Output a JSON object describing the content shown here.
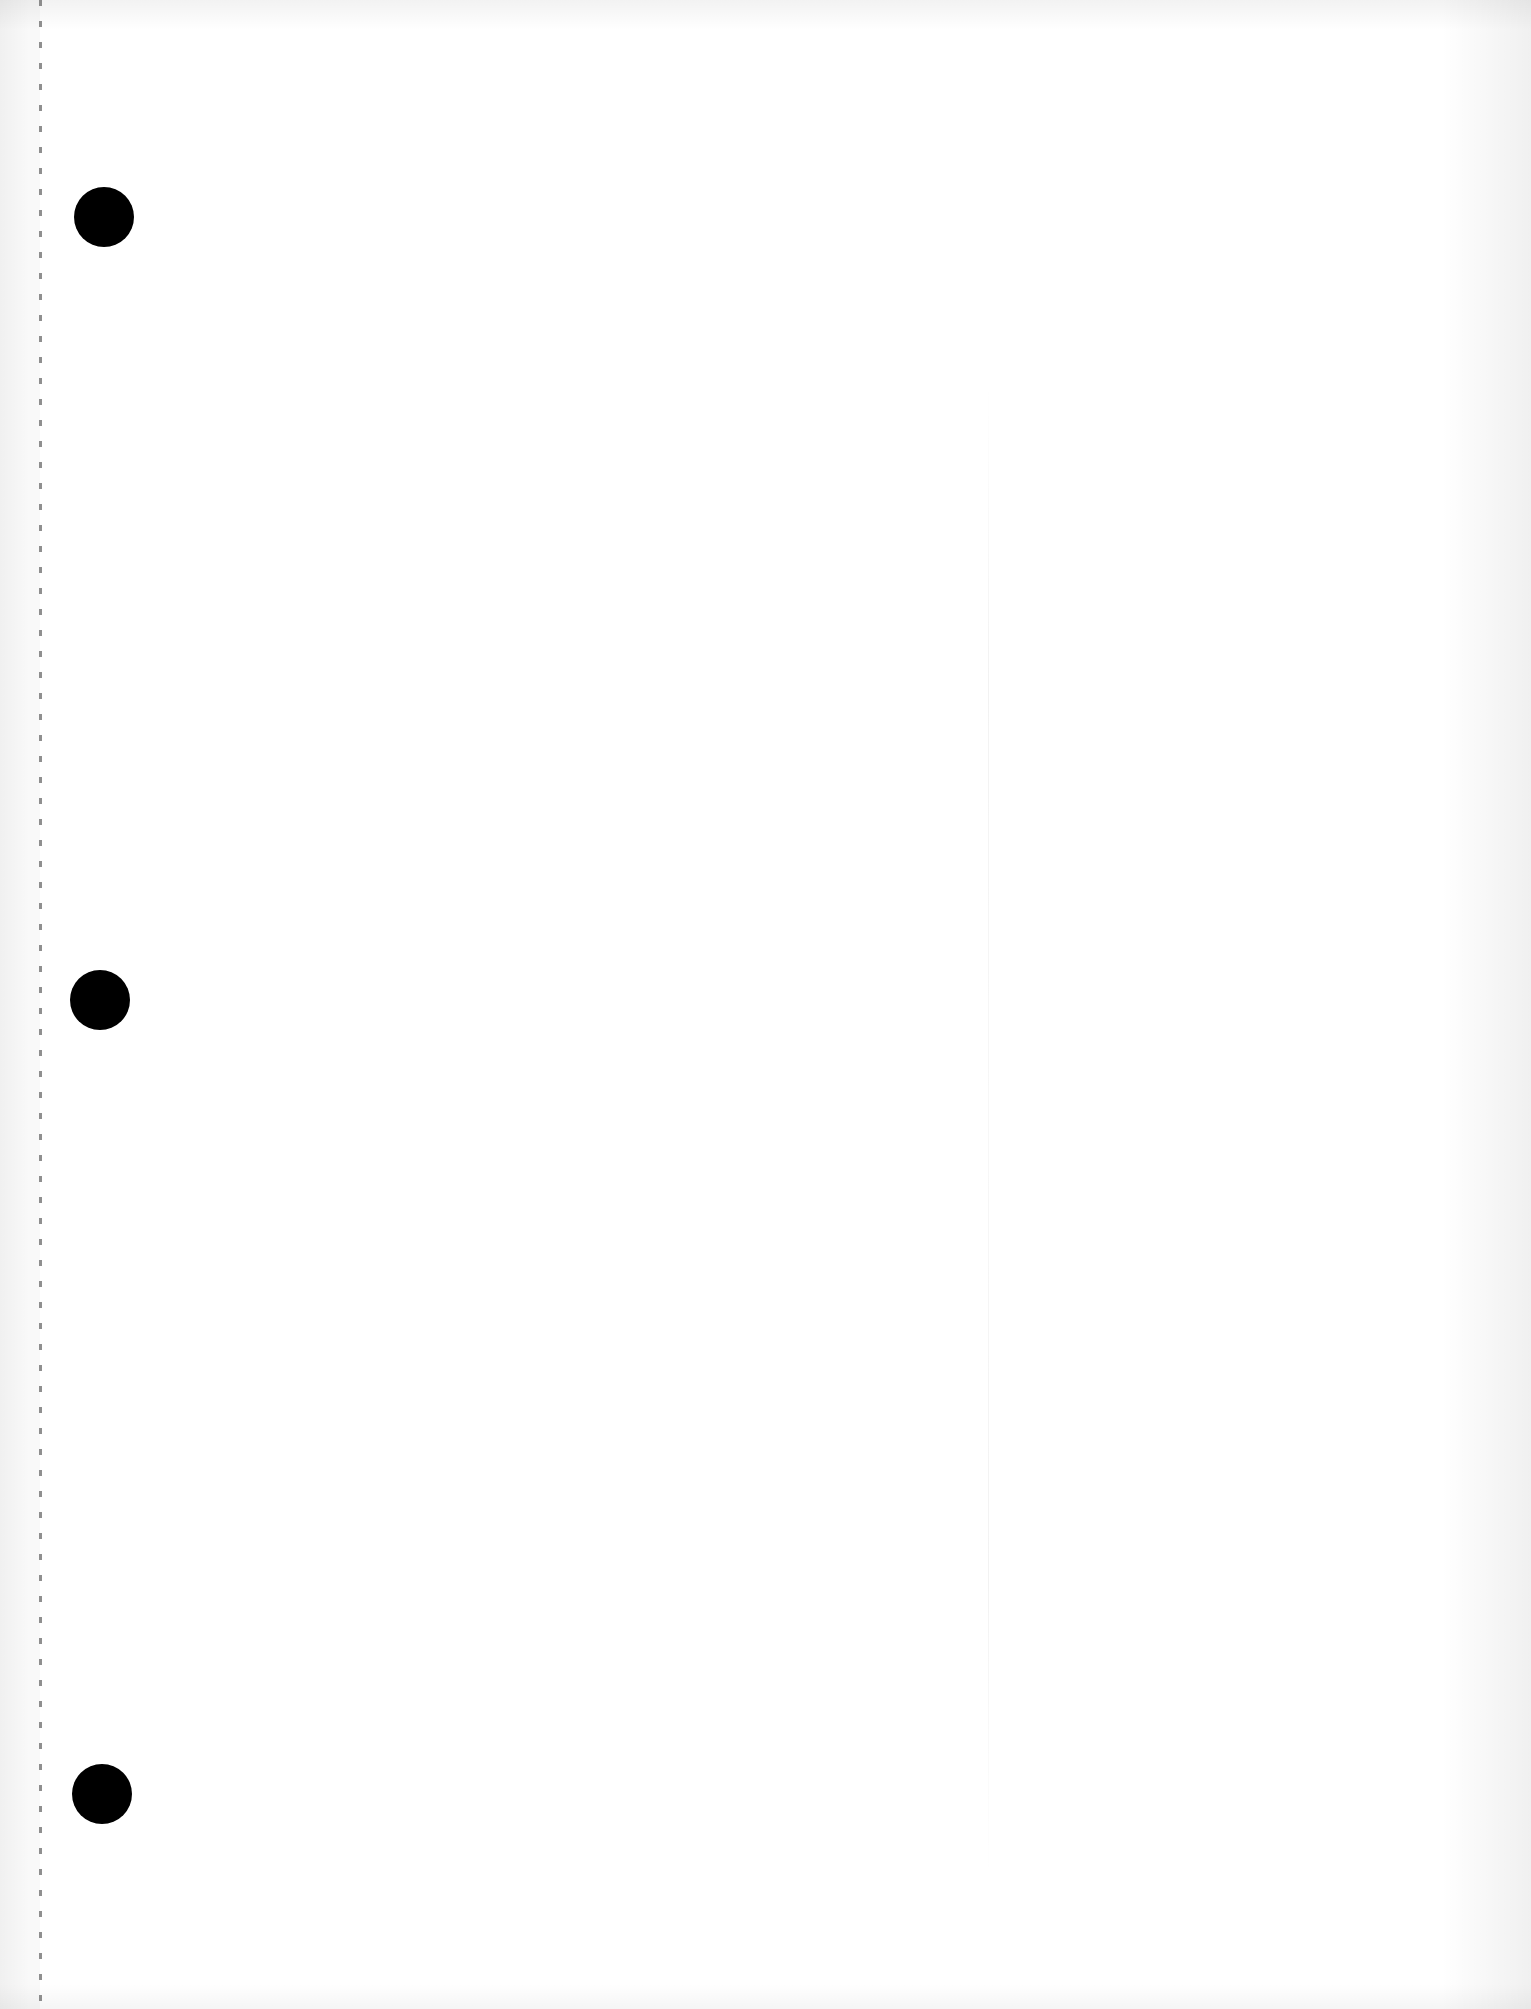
{
  "document": {
    "type": "blank-loose-leaf-sheet",
    "text_content": "",
    "paper_color": "#ffffff",
    "punch_holes": [
      {
        "id": 1,
        "cx": 104,
        "cy": 217,
        "diameter": 60,
        "color": "#000000"
      },
      {
        "id": 2,
        "cx": 100,
        "cy": 1000,
        "diameter": 60,
        "color": "#000000"
      },
      {
        "id": 3,
        "cx": 102,
        "cy": 1794,
        "diameter": 60,
        "color": "#000000"
      }
    ],
    "perforation": {
      "x": 40,
      "dash_spacing": 21,
      "color": "#6a6a6a"
    }
  }
}
